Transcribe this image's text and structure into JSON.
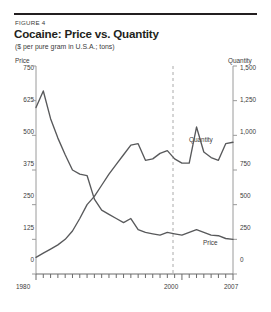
{
  "figure": {
    "number_label": "FIGURE 4",
    "title": "Cocaine: Price vs. Quantity",
    "subtitle": "($ per pure gram in U.S.A.; tons)"
  },
  "axes": {
    "left_title": "Price",
    "right_title": "Quantity",
    "left_ticks": [
      "750",
      "625",
      "500",
      "375",
      "250",
      "125",
      "0"
    ],
    "right_ticks": [
      "1,500",
      "1,250",
      "1,000",
      "750",
      "500",
      "250",
      "0"
    ],
    "x_ticks": [
      "1980",
      "2000",
      "2007"
    ]
  },
  "series_labels": {
    "quantity": "Quantity",
    "price": "Price"
  },
  "colors": {
    "line": "#58595b",
    "rule": "#231f20",
    "axis": "#9a9a9a",
    "text": "#3a3a3a",
    "marker_line": "#aaaaaa"
  },
  "chart_data": {
    "type": "line",
    "title": "Cocaine: Price vs. Quantity",
    "subtitle": "($ per pure gram in U.S.A.; tons)",
    "xlabel": "",
    "ylabel": "Price",
    "y2label": "Quantity",
    "xlim": [
      1980,
      2007
    ],
    "ylim": [
      0,
      750
    ],
    "y2lim": [
      0,
      1500
    ],
    "grid": false,
    "legend": "inline-labels",
    "annotations": [
      {
        "type": "vertical-dashed-line",
        "x": 2000,
        "label": "2000"
      }
    ],
    "x": [
      1980,
      1981,
      1982,
      1983,
      1984,
      1985,
      1986,
      1987,
      1988,
      1989,
      1990,
      1991,
      1992,
      1993,
      1994,
      1995,
      1996,
      1997,
      1998,
      1999,
      2000,
      2001,
      2002,
      2003,
      2004,
      2005,
      2006,
      2007
    ],
    "series": [
      {
        "name": "Price",
        "axis": "left",
        "units": "$ per pure gram",
        "values": [
          600,
          660,
          560,
          490,
          430,
          375,
          360,
          355,
          270,
          230,
          215,
          200,
          185,
          200,
          160,
          150,
          145,
          140,
          150,
          145,
          140,
          150,
          160,
          150,
          140,
          138,
          128,
          125
        ]
      },
      {
        "name": "Quantity",
        "axis": "right",
        "units": "tons",
        "values": [
          120,
          150,
          180,
          210,
          250,
          310,
          400,
          500,
          560,
          640,
          720,
          790,
          860,
          930,
          940,
          820,
          830,
          870,
          890,
          830,
          800,
          800,
          1060,
          880,
          840,
          820,
          940,
          950
        ]
      }
    ]
  }
}
